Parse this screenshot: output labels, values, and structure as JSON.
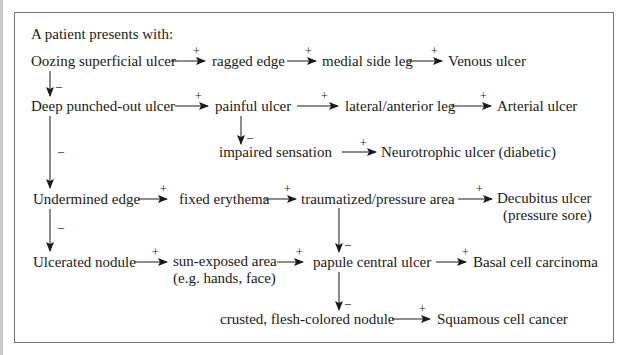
{
  "title": "A patient presents with:",
  "nodes": {
    "oozing": "Oozing superficial ulcer",
    "ragged": "ragged edge",
    "medial": "medial side leg",
    "venous": "Venous ulcer",
    "deep": "Deep punched-out ulcer",
    "painful": "painful ulcer",
    "lateral": "lateral/anterior leg",
    "arterial": "Arterial ulcer",
    "impaired": "impaired sensation",
    "neuro": "Neurotrophic ulcer (diabetic)",
    "undermined": "Undermined edge",
    "fixed": "fixed erythema",
    "trauma": "traumatized/pressure area",
    "decubitus_1": "Decubitus ulcer",
    "decubitus_2": "(pressure sore)",
    "nodule": "Ulcerated nodule",
    "sun_1": "sun-exposed area",
    "sun_2": "(e.g. hands, face)",
    "papule": "papule central ulcer",
    "basal": "Basal cell carcinoma",
    "crusted": "crusted, flesh-colored nodule",
    "squamous": "Squamous cell cancer"
  },
  "signs": {
    "plus": "+",
    "minus": "–"
  },
  "colors": {
    "border": "#777777",
    "line": "#1a1a1a",
    "background": "#ffffff"
  }
}
